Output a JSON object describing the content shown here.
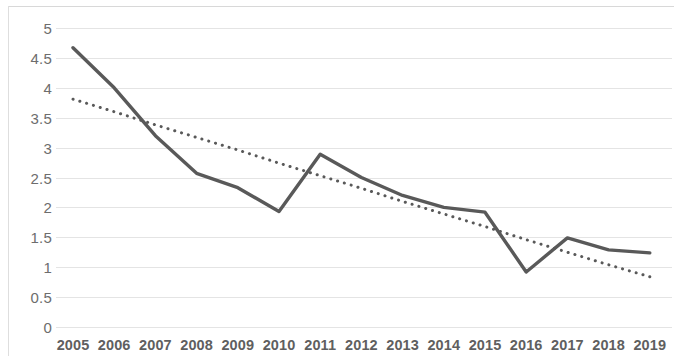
{
  "chart_data": {
    "type": "line",
    "title": "",
    "subtitle": "",
    "xlabel": "",
    "ylabel": "",
    "categories": [
      "2005",
      "2006",
      "2007",
      "2008",
      "2009",
      "2010",
      "2011",
      "2012",
      "2013",
      "2014",
      "2015",
      "2016",
      "2017",
      "2018",
      "2019"
    ],
    "series": [
      {
        "name": "value",
        "style": "solid",
        "color": "#595959",
        "values": [
          4.67,
          4.0,
          3.2,
          2.57,
          2.33,
          1.93,
          2.89,
          2.5,
          2.2,
          2.0,
          1.92,
          0.92,
          1.49,
          1.29,
          1.24
        ]
      },
      {
        "name": "trendline",
        "style": "dotted",
        "color": "#595959",
        "values": [
          3.81,
          3.6,
          3.38,
          3.17,
          2.96,
          2.74,
          2.53,
          2.32,
          2.1,
          1.89,
          1.68,
          1.46,
          1.25,
          1.04,
          0.84
        ]
      }
    ],
    "ylim": [
      0,
      5
    ],
    "yticks": [
      "0",
      "0.5",
      "1",
      "1.5",
      "2",
      "2.5",
      "3",
      "3.5",
      "4",
      "4.5",
      "5"
    ],
    "ytick_values": [
      0,
      0.5,
      1,
      1.5,
      2,
      2.5,
      3,
      3.5,
      4,
      4.5,
      5
    ],
    "grid": true,
    "grid_axis": "y",
    "legend": "none",
    "annotations": []
  },
  "axis_colors": {
    "grid": "#e4e4e4",
    "tick_text": "#6d6d6d",
    "frame": "#dedede"
  }
}
